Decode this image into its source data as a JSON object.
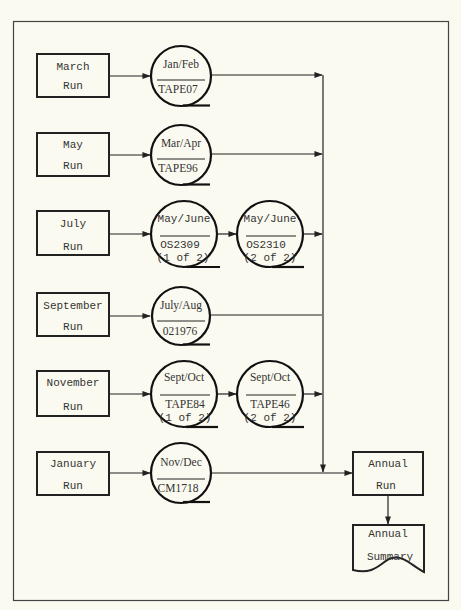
{
  "diagram": {
    "colors": {
      "background": "#fbfaf0",
      "stroke": "#222222",
      "frame": "#444444"
    },
    "rows": [
      {
        "run": {
          "line1": "March",
          "line2": "Run"
        },
        "tapes": [
          {
            "period": "Jan/Feb",
            "label": "TAPE07",
            "sub": ""
          }
        ]
      },
      {
        "run": {
          "line1": "May",
          "line2": "Run"
        },
        "tapes": [
          {
            "period": "Mar/Apr",
            "label": "TAPE96",
            "sub": ""
          }
        ]
      },
      {
        "run": {
          "line1": "July",
          "line2": "Run"
        },
        "tapes": [
          {
            "period": "May/June",
            "label": "OS2309",
            "sub": "(1 of 2)"
          },
          {
            "period": "May/June",
            "label": "OS2310",
            "sub": "(2 of 2)"
          }
        ]
      },
      {
        "run": {
          "line1": "September",
          "line2": "Run"
        },
        "tapes": [
          {
            "period": "July/Aug",
            "label": "021976",
            "sub": ""
          }
        ]
      },
      {
        "run": {
          "line1": "November",
          "line2": "Run"
        },
        "tapes": [
          {
            "period": "Sept/Oct",
            "label": "TAPE84",
            "sub": "(1 of 2)"
          },
          {
            "period": "Sept/Oct",
            "label": "TAPE46",
            "sub": "(2 of 2)"
          }
        ]
      },
      {
        "run": {
          "line1": "January",
          "line2": "Run"
        },
        "tapes": [
          {
            "period": "Nov/Dec",
            "label": "CM1718",
            "sub": ""
          }
        ]
      }
    ],
    "annual_run": {
      "line1": "Annual",
      "line2": "Run"
    },
    "annual_summary": {
      "line1": "Annual",
      "line2": "Summary"
    }
  }
}
